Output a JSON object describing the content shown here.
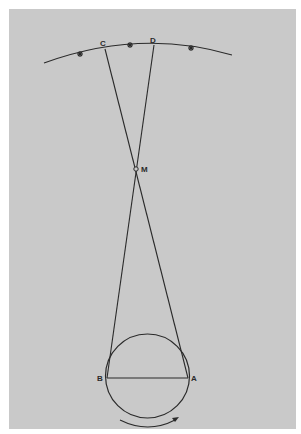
{
  "diagram": {
    "type": "geometric-construction",
    "colors": {
      "background": "#c9c9c9",
      "ink": "#2a2a2a",
      "page": "#ffffff"
    },
    "labels": {
      "C": "C",
      "D": "D",
      "M": "M",
      "B": "B",
      "A": "A"
    },
    "stars": [
      "*",
      "*",
      "*"
    ],
    "elements": {
      "sky_arc": "celestial arc with three stars",
      "circle": "circle with diameter BA",
      "lines": [
        "A-C through M",
        "B-D through M"
      ],
      "rotation_arrow": "clockwise rotation arrow under circle"
    }
  }
}
